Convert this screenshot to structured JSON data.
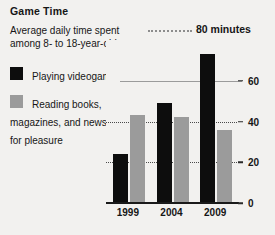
{
  "header": {
    "title": "Game Time",
    "subtitle": "Average daily time spent among 8- to 18-year-olds"
  },
  "legend": {
    "items": [
      {
        "label": "Playing videogames",
        "color": "#0d0d0d"
      },
      {
        "label": "Reading books, magazines, and newspapers for pleasure",
        "color": "#9b9b9b"
      }
    ]
  },
  "annotation": {
    "text": "80 minutes",
    "value": 80
  },
  "axis": {
    "ticks": [
      "0",
      "20",
      "40",
      "60"
    ],
    "x_labels": [
      "1999",
      "2004",
      "2009"
    ]
  },
  "chart_data": {
    "type": "bar",
    "title": "Game Time",
    "subtitle": "Average daily time spent among 8- to 18-year-olds",
    "categories": [
      "1999",
      "2004",
      "2009"
    ],
    "series": [
      {
        "name": "Playing videogames",
        "color": "#0d0d0d",
        "values": [
          24,
          49,
          73
        ]
      },
      {
        "name": "Reading books, magazines, and newspapers for pleasure",
        "color": "#9b9b9b",
        "values": [
          43,
          42,
          36
        ]
      }
    ],
    "xlabel": "",
    "ylabel": "minutes",
    "ylim": [
      0,
      80
    ],
    "yticks": [
      0,
      20,
      40,
      60
    ],
    "gridlines": [
      {
        "value": 20,
        "style": "dotted"
      },
      {
        "value": 40,
        "style": "dotted"
      },
      {
        "value": 60,
        "style": "solid"
      }
    ],
    "annotations": [
      {
        "value": 80,
        "text": "80 minutes",
        "style": "dotted-leader"
      }
    ],
    "legend_position": "left",
    "grid": true
  }
}
